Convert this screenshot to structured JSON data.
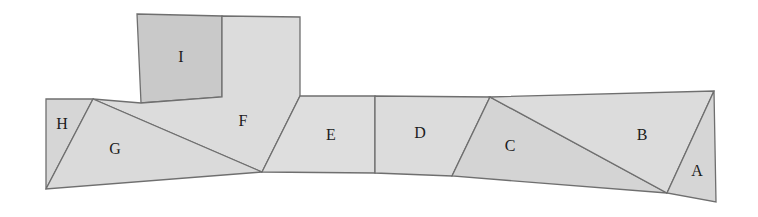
{
  "diagram": {
    "colors": {
      "light_fill": "#dcdcdc",
      "dark_fill": "#c9c9c9",
      "stroke": "#6f6f6f",
      "label": "#1c1c1c"
    },
    "pieces": [
      {
        "id": "I",
        "label": "I",
        "fill": "#c9c9c9",
        "points": "137,14 222,16 222,97 141,103",
        "lx": 181,
        "ly": 58
      },
      {
        "id": "F",
        "label": "F",
        "fill": "#dcdcdc",
        "points": "222,16 300,17 300,96 262,172 93,99 141,103 222,97",
        "lx": 243,
        "ly": 122
      },
      {
        "id": "H",
        "label": "H",
        "fill": "#d6d6d6",
        "points": "46,99 93,99 46,189",
        "lx": 62,
        "ly": 125
      },
      {
        "id": "G",
        "label": "G",
        "fill": "#dadada",
        "points": "93,99 262,172 46,189",
        "lx": 115,
        "ly": 150
      },
      {
        "id": "E",
        "label": "E",
        "fill": "#dedede",
        "points": "300,96 375,96 375,173 262,172",
        "lx": 331,
        "ly": 136
      },
      {
        "id": "D",
        "label": "D",
        "fill": "#dcdcdc",
        "points": "375,96 490,97 452,176 375,173",
        "lx": 420,
        "ly": 134
      },
      {
        "id": "C",
        "label": "C",
        "fill": "#d4d4d4",
        "points": "490,97 667,193 452,176",
        "lx": 510,
        "ly": 147
      },
      {
        "id": "B",
        "label": "B",
        "fill": "#dcdcdc",
        "points": "490,97 714,91 667,193",
        "lx": 642,
        "ly": 136
      },
      {
        "id": "A",
        "label": "A",
        "fill": "#d6d6d6",
        "points": "714,91 716,202 667,193",
        "lx": 697,
        "ly": 172
      }
    ]
  }
}
